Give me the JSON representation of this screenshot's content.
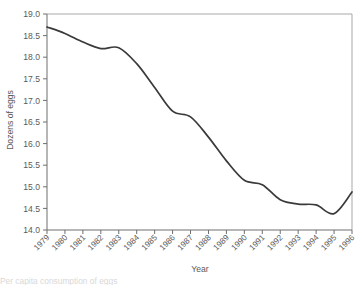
{
  "chart_data": {
    "type": "line",
    "title": "",
    "xlabel": "Year",
    "ylabel": "Dozens of eggs",
    "x": [
      1979,
      1980,
      1981,
      1982,
      1983,
      1984,
      1985,
      1986,
      1987,
      1988,
      1989,
      1990,
      1991,
      1992,
      1993,
      1994,
      1995,
      1996
    ],
    "categories": [
      "1979",
      "1980",
      "1981",
      "1982",
      "1983",
      "1984",
      "1985",
      "1986",
      "1987",
      "1988",
      "1989",
      "1990",
      "1991",
      "1992",
      "1993",
      "1994",
      "1995",
      "1996"
    ],
    "values": [
      18.7,
      18.55,
      18.35,
      18.2,
      18.22,
      17.85,
      17.3,
      16.75,
      16.62,
      16.15,
      15.6,
      15.15,
      15.05,
      14.7,
      14.6,
      14.58,
      14.38,
      14.88
    ],
    "series": [
      {
        "name": "Dozens of eggs",
        "values": [
          18.7,
          18.55,
          18.35,
          18.2,
          18.22,
          17.85,
          17.3,
          16.75,
          16.62,
          16.15,
          15.6,
          15.15,
          15.05,
          14.7,
          14.6,
          14.58,
          14.38,
          14.88
        ],
        "color": "#3a3a3a"
      }
    ],
    "ylim": [
      14.0,
      19.0
    ],
    "ytick_step": 0.5,
    "ytick_labels": [
      "19.0",
      "18.5",
      "18.0",
      "17.5",
      "17.0",
      "16.5",
      "16.0",
      "15.5",
      "15.0",
      "14.5",
      "14.0"
    ],
    "ytick_values": [
      19.0,
      18.5,
      18.0,
      17.5,
      17.0,
      16.5,
      16.0,
      15.5,
      15.0,
      14.5,
      14.0
    ],
    "xlim": [
      1979,
      1996
    ],
    "grid": false,
    "legend": false,
    "legend_position": "none",
    "smoothing": "spline",
    "frame": "box",
    "annotations": []
  },
  "caption": {
    "partial_text": "Per capita consumption of eggs"
  },
  "colors": {
    "line": "#3a3a3a",
    "axis": "#6e6e6e",
    "frame": "#a9a9a9",
    "text": "#5a5a5a",
    "background": "#ffffff"
  }
}
